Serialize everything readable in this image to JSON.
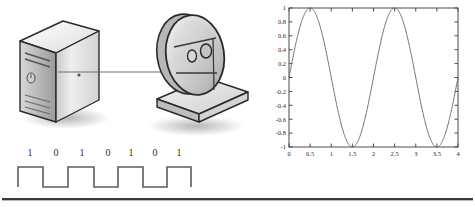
{
  "figure": {
    "name": "server-satellite-signal-diagram",
    "background_color": "#ffffff"
  },
  "illustration": {
    "server": {
      "name": "server-tower",
      "label": "",
      "body_color": "#d6d6d6",
      "top_color": "#f0f0f0",
      "side_color": "#a8a8a8",
      "outline_color": "#2a2a2a",
      "shadow_color": "#c9c9c9"
    },
    "satellite": {
      "name": "satellite-dish",
      "label": "",
      "dish_color": "#cfcfcf",
      "dish_light": "#e8e8e8",
      "base_color": "#dcdcdc",
      "outline_color": "#2a2a2a"
    },
    "link": {
      "name": "signal-link-line",
      "label": "",
      "color": "#6e6e6e"
    }
  },
  "waveform": {
    "name": "digital-square-wave",
    "bits": [
      "1",
      "0",
      "1",
      "0",
      "1",
      "0",
      "1"
    ],
    "line_color": "#5d5d5d",
    "high_label": "1",
    "low_label": "0"
  },
  "chart_data": {
    "type": "line",
    "title": "",
    "xlabel": "",
    "ylabel": "",
    "xlim": [
      0,
      4
    ],
    "ylim": [
      -1,
      1
    ],
    "grid": false,
    "legend": "none",
    "line_color": "#707070",
    "axis_color": "#4a4a4a",
    "xticks": [
      "0",
      "0.5",
      "1",
      "1.5",
      "2",
      "2.5",
      "3",
      "3.5",
      "4"
    ],
    "xtick_values": [
      0,
      0.5,
      1,
      1.5,
      2,
      2.5,
      3,
      3.5,
      4
    ],
    "yticks": [
      "1",
      "0.8",
      "0.6",
      "0.4",
      "0.2",
      "0",
      "-0.2",
      "-0.4",
      "-0.6",
      "-0.8",
      "-1"
    ],
    "ytick_values": [
      1,
      0.8,
      0.6,
      0.4,
      0.2,
      0,
      -0.2,
      -0.4,
      -0.6,
      -0.8,
      -1
    ],
    "series": [
      {
        "name": "sine",
        "expression": "sin(pi*x)",
        "x": [
          0,
          0.1,
          0.2,
          0.3,
          0.4,
          0.5,
          0.6,
          0.7,
          0.8,
          0.9,
          1.0,
          1.1,
          1.2,
          1.3,
          1.4,
          1.5,
          1.6,
          1.7,
          1.8,
          1.9,
          2.0,
          2.1,
          2.2,
          2.3,
          2.4,
          2.5,
          2.6,
          2.7,
          2.8,
          2.9,
          3.0,
          3.1,
          3.2,
          3.3,
          3.4,
          3.5,
          3.6,
          3.7,
          3.8,
          3.9,
          4.0
        ],
        "values": [
          0.0,
          0.309,
          0.588,
          0.809,
          0.951,
          1.0,
          0.951,
          0.809,
          0.588,
          0.309,
          0.0,
          -0.309,
          -0.588,
          -0.809,
          -0.951,
          -1.0,
          -0.951,
          -0.809,
          -0.588,
          -0.309,
          0.0,
          0.309,
          0.588,
          0.809,
          0.951,
          1.0,
          0.951,
          0.809,
          0.588,
          0.309,
          0.0,
          -0.309,
          -0.588,
          -0.809,
          -0.951,
          -1.0,
          -0.951,
          -0.809,
          -0.588,
          -0.309,
          0.0
        ]
      }
    ]
  },
  "rule": {
    "name": "bottom-divider",
    "color": "#3a3a3a"
  }
}
